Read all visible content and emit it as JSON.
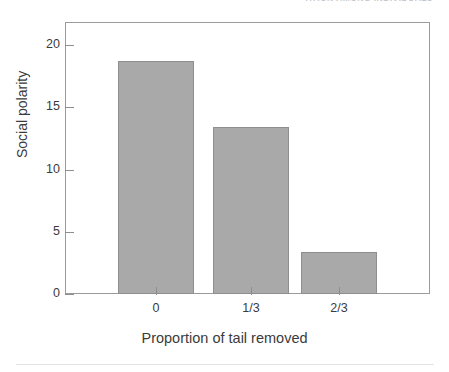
{
  "page": {
    "running_head": "ATION AMONG INDIVIDUALS"
  },
  "chart_data": {
    "type": "bar",
    "title": "",
    "categories": [
      "0",
      "1/3",
      "2/3"
    ],
    "values": [
      18.7,
      13.4,
      3.4
    ],
    "xlabel": "Proportion of tail removed",
    "ylabel": "Social polarity",
    "ylim": [
      0,
      20
    ],
    "yticks": [
      0,
      5,
      10,
      15,
      20
    ],
    "ytick_labels": [
      "0",
      "5",
      "10",
      "15",
      "20"
    ],
    "grid": false,
    "legend": false,
    "bar_color": "#a9a9a9",
    "bar_edge_color": "#8e8e8e",
    "axis_color": "#9b9b9b",
    "text_color": "#3b3b3b"
  }
}
